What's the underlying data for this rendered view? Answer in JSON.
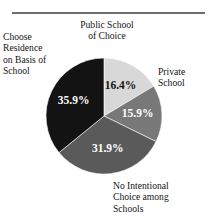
{
  "chart_data": {
    "type": "pie",
    "title": "",
    "subtitle": "",
    "xlabel": "",
    "ylabel": "",
    "legend_position": "none",
    "grid": false,
    "units": "percent",
    "categories": [
      "Public School of Choice",
      "Private School",
      "No Intentional Choice among Schools",
      "Choose Residence on Basis of School"
    ],
    "values": [
      16.4,
      15.9,
      31.9,
      35.9
    ],
    "value_labels": [
      "16.4%",
      "15.9%",
      "31.9%",
      "35.9%"
    ],
    "colors": [
      "#d8d8d8",
      "#787878",
      "#5a5a5a",
      "#131313"
    ],
    "label_colors": [
      "#141414",
      "#ffffff",
      "#ffffff",
      "#ffffff"
    ],
    "start_angle_deg": 0,
    "direction": "clockwise",
    "slices": [
      {
        "label": "Public School of Choice",
        "label_lines": "Public School\nof Choice",
        "value": 16.4,
        "value_label": "16.4%",
        "color": "#d8d8d8",
        "value_text_color": "#141414",
        "label_position": "top"
      },
      {
        "label": "Private School",
        "label_lines": "Private\nSchool",
        "value": 15.9,
        "value_label": "15.9%",
        "color": "#787878",
        "value_text_color": "#ffffff",
        "label_position": "right"
      },
      {
        "label": "No Intentional Choice among Schools",
        "label_lines": "No Intentional\nChoice among\nSchools",
        "value": 31.9,
        "value_label": "31.9%",
        "color": "#5a5a5a",
        "value_text_color": "#ffffff",
        "label_position": "bottom-right"
      },
      {
        "label": "Choose Residence on Basis of School",
        "label_lines": "Choose\nResidence\non Basis of\nSchool",
        "value": 35.9,
        "value_label": "35.9%",
        "color": "#131313",
        "value_text_color": "#ffffff",
        "label_position": "left"
      }
    ]
  },
  "figure": {
    "rule_color": "#6e6e6e",
    "background": "#ffffff",
    "pie_center_x": 104,
    "pie_center_y": 116,
    "pie_radius": 58
  }
}
